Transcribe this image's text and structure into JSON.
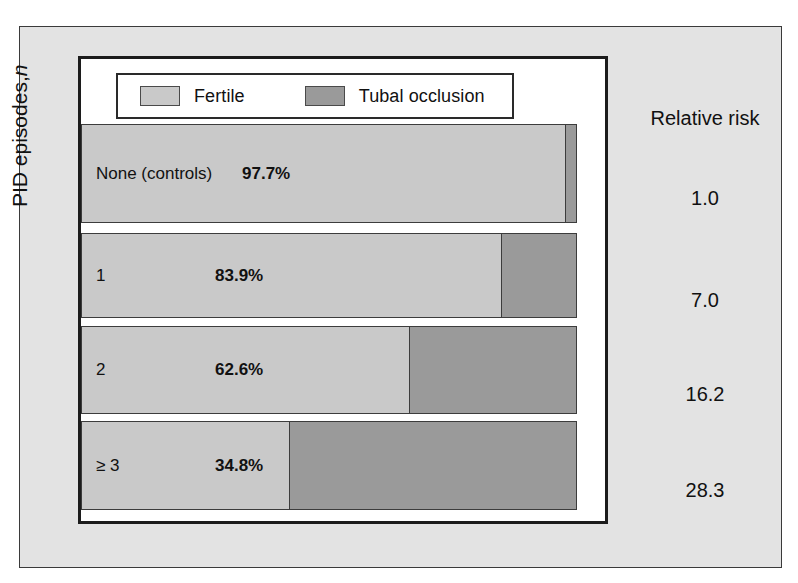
{
  "figure": {
    "y_axis_title_main": "PID episodes,",
    "y_axis_title_italic": "n",
    "right_column_header": "Relative risk"
  },
  "legend": {
    "items": [
      {
        "label": "Fertile",
        "color": "#c9c9c9",
        "swatch_name": "legend-swatch-fertile"
      },
      {
        "label": "Tubal occlusion",
        "color": "#9a9a9a",
        "swatch_name": "legend-swatch-tubal-occlusion"
      }
    ]
  },
  "chart_data": {
    "type": "bar",
    "title": "",
    "subtitle": "",
    "orientation": "horizontal",
    "stacked": true,
    "stack_total_percent": 100,
    "xlabel": "",
    "ylabel": "PID episodes, n",
    "grid": false,
    "legend_position": "top-left",
    "legend": [
      "Fertile",
      "Tubal occlusion"
    ],
    "categories": [
      "None (controls)",
      "1",
      "2",
      "≥ 3"
    ],
    "series": [
      {
        "name": "Fertile",
        "color": "#c9c9c9",
        "values": [
          97.7,
          83.9,
          62.6,
          34.8
        ]
      },
      {
        "name": "Tubal occlusion",
        "color": "#9a9a9a",
        "values": [
          2.3,
          16.1,
          37.4,
          65.2
        ]
      }
    ],
    "data_labels": [
      "97.7%",
      "83.9%",
      "62.6%",
      "34.8%"
    ],
    "annotations": {
      "relative_risk_header": "Relative risk",
      "relative_risk": [
        "1.0",
        "7.0",
        "16.2",
        "28.3"
      ]
    }
  },
  "rows": [
    {
      "category": "None (controls)",
      "percent_label": "97.7%",
      "fertile_pct": 97.7,
      "occlusion_pct": 2.3,
      "relative_risk": "1.0",
      "draw_fertile_frac": 0.977,
      "top": 0,
      "height": 99,
      "label_left": 14,
      "pct_left": 160
    },
    {
      "category": "1",
      "percent_label": "83.9%",
      "fertile_pct": 83.9,
      "occlusion_pct": 16.1,
      "relative_risk": "7.0",
      "draw_fertile_frac": 0.849,
      "top": 109,
      "height": 85,
      "label_left": 14,
      "pct_left": 133
    },
    {
      "category": "2",
      "percent_label": "62.6%",
      "fertile_pct": 62.6,
      "occlusion_pct": 37.4,
      "relative_risk": "16.2",
      "draw_fertile_frac": 0.663,
      "top": 202,
      "height": 88,
      "label_left": 14,
      "pct_left": 133
    },
    {
      "category": "≥ 3",
      "percent_label": "34.8%",
      "fertile_pct": 34.8,
      "occlusion_pct": 65.2,
      "relative_risk": "28.3",
      "draw_fertile_frac": 0.421,
      "top": 297,
      "height": 89,
      "label_left": 14,
      "pct_left": 133
    }
  ],
  "colors": {
    "panel_background": "#e3e3e3",
    "plot_background": "#ffffff",
    "fertile": "#c9c9c9",
    "occlusion": "#9a9a9a",
    "border": "#1c1c1c",
    "text": "#111111"
  }
}
